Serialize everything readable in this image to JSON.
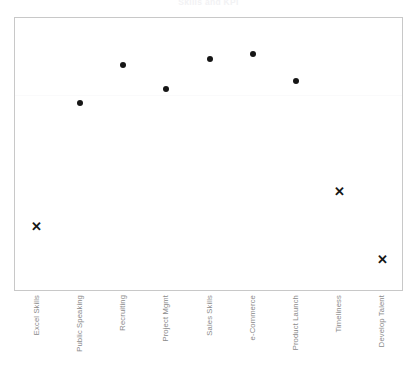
{
  "chart_data": {
    "type": "scatter",
    "title": "Skills and KPI",
    "xlabel": "",
    "ylabel": "",
    "grid": true,
    "grid_axis": "y",
    "legend": false,
    "categories": [
      "Excel Skills",
      "Public Speaking",
      "Recruiting",
      "Project Mgmt",
      "Sales Skills",
      "e-Commerce",
      "Product Launch",
      "Timeliness",
      "Develop Talent"
    ],
    "ylim": [
      0,
      100
    ],
    "yticks_visible": false,
    "series": [
      {
        "name": "Above Target",
        "marker": "circle",
        "color": "#161616",
        "points": [
          {
            "category": "Public Speaking",
            "value": 69
          },
          {
            "category": "Recruiting",
            "value": 83
          },
          {
            "category": "Project Mgmt",
            "value": 74
          },
          {
            "category": "Sales Skills",
            "value": 85
          },
          {
            "category": "e-Commerce",
            "value": 87
          },
          {
            "category": "Product Launch",
            "value": 77
          }
        ]
      },
      {
        "name": "Below Target",
        "marker": "x",
        "color": "#161616",
        "points": [
          {
            "category": "Excel Skills",
            "value": 24
          },
          {
            "category": "Timeliness",
            "value": 37
          },
          {
            "category": "Develop Talent",
            "value": 12
          }
        ]
      }
    ],
    "annotations": [
      {
        "type": "hline",
        "value": 72,
        "color": "#fafafb"
      }
    ]
  },
  "axis": {
    "frame_color": "#c8c8c8",
    "label_color": "#8a8a8a"
  }
}
